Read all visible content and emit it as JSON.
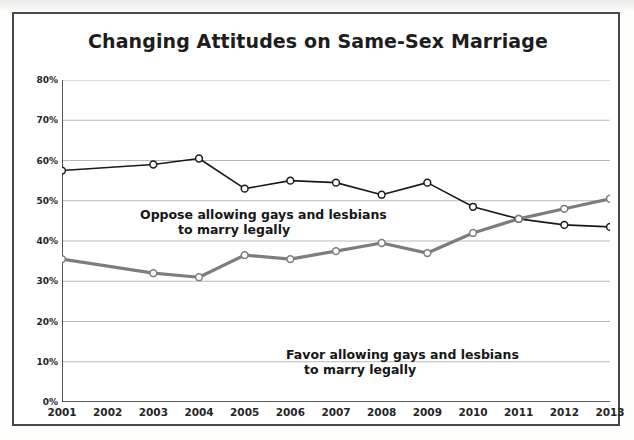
{
  "figure": {
    "title": "Changing Attitudes on Same-Sex Marriage",
    "annotation_oppose_line1": "Oppose allowing gays and lesbians",
    "annotation_oppose_line2": "to marry legally",
    "annotation_favor_line1": "Favor allowing gays and lesbians",
    "annotation_favor_line2": "to marry legally",
    "colors": {
      "oppose_line": "#1a1a1a",
      "favor_line": "#7d7d7d",
      "gridline": "#b9b9b9",
      "axis": "#2b2b2b",
      "frame": "#4a4a4a",
      "marker_fill": "#ffffff"
    }
  },
  "chart_data": {
    "type": "line",
    "title": "Changing Attitudes on Same-Sex Marriage",
    "xlabel": "",
    "ylabel": "",
    "x": [
      2001,
      2002,
      2003,
      2004,
      2005,
      2006,
      2007,
      2008,
      2009,
      2010,
      2011,
      2012,
      2013
    ],
    "categories": [
      "2001",
      "2002",
      "2003",
      "2004",
      "2005",
      "2006",
      "2007",
      "2008",
      "2009",
      "2010",
      "2011",
      "2012",
      "2013"
    ],
    "xlim": [
      2001,
      2013
    ],
    "ylim": [
      0,
      80
    ],
    "y_ticks": [
      0,
      10,
      20,
      30,
      40,
      50,
      60,
      70,
      80
    ],
    "y_tick_labels": [
      "0%",
      "10%",
      "20%",
      "30%",
      "40%",
      "50%",
      "60%",
      "70%",
      "80%"
    ],
    "grid": true,
    "grid_axis": "y",
    "legend": "inline-annotations",
    "series": [
      {
        "name": "Oppose allowing gays and lesbians to marry legally",
        "color": "#1a1a1a",
        "line_width": 1.6,
        "marker": "circle-open",
        "values": [
          57.5,
          null,
          59.0,
          60.5,
          53.0,
          55.0,
          54.5,
          51.5,
          54.5,
          48.5,
          45.5,
          44.0,
          43.5
        ]
      },
      {
        "name": "Favor allowing gays and lesbians to marry legally",
        "color": "#7d7d7d",
        "line_width": 3.2,
        "marker": "circle-open",
        "values": [
          35.5,
          null,
          32.0,
          31.0,
          36.5,
          35.5,
          37.5,
          39.5,
          37.0,
          42.0,
          45.5,
          48.0,
          50.5
        ]
      }
    ],
    "annotations": [
      {
        "text": "Oppose allowing gays and lesbians to marry legally",
        "series": "Oppose allowing gays and lesbians to marry legally"
      },
      {
        "text": "Favor allowing gays and lesbians to marry legally",
        "series": "Favor allowing gays and lesbians to marry legally"
      }
    ]
  }
}
